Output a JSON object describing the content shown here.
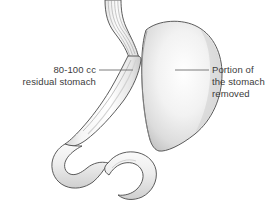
{
  "figure": {
    "background_color": "#ffffff",
    "outline_color": "#4a4a4a",
    "fill_light": "#fdfdfd",
    "fill_mid": "#e2e2e2",
    "fill_shadow": "#c9c9c9",
    "text_color": "#3b3b3b",
    "leader_color": "#6e6e6e"
  },
  "labels": {
    "left": {
      "name": "residual-stomach-label",
      "lines": [
        "80-100 cc",
        "residual stomach"
      ],
      "leader": {
        "x1": 99,
        "y1": 70,
        "x2": 133,
        "y2": 70
      }
    },
    "right": {
      "name": "removed-portion-label",
      "lines": [
        "Portion of",
        "the stomach",
        "removed"
      ],
      "leader": {
        "x1": 175,
        "y1": 70,
        "x2": 209,
        "y2": 70
      }
    }
  },
  "anatomy": {
    "esophagus": "esophagus-with-longitudinal-folds",
    "residual_sleeve": "residual-gastric-sleeve",
    "removed_portion": "resected-gastric-fundus-and-body",
    "duodenum": "duodenum-c-loop",
    "staple_line": "gastric-division-line"
  }
}
